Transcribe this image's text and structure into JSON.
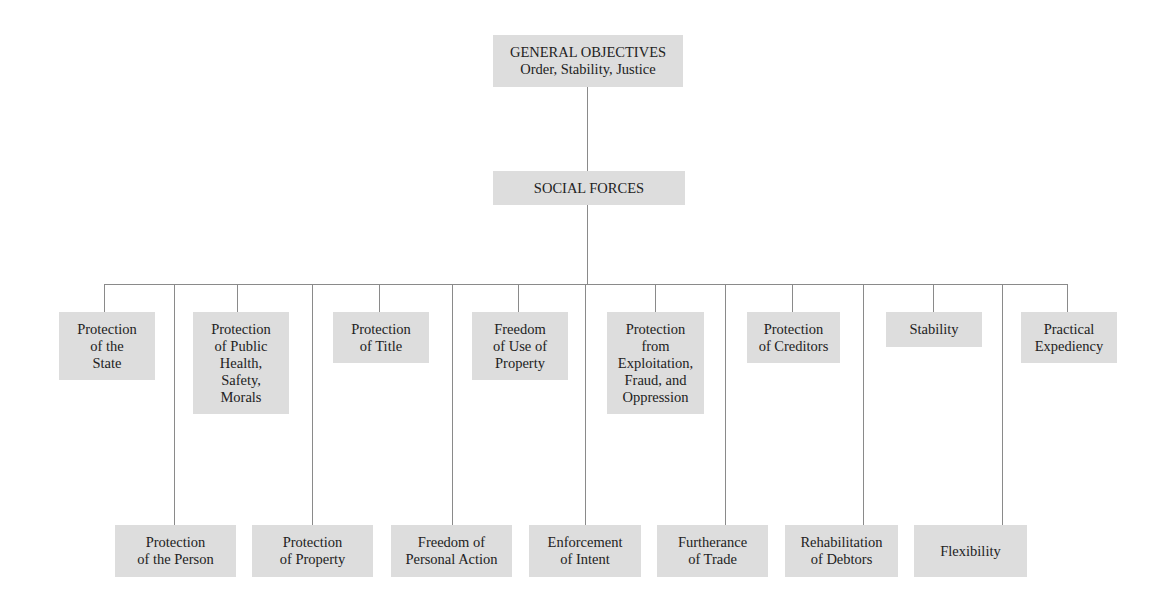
{
  "diagram": {
    "root": {
      "title": "GENERAL OBJECTIVES",
      "subtitle": "Order, Stability, Justice"
    },
    "middle": {
      "title": "SOCIAL FORCES"
    },
    "upper_row": [
      {
        "label": "Protection\nof the\nState"
      },
      {
        "label": "Protection\nof Public\nHealth,\nSafety,\nMorals"
      },
      {
        "label": "Protection\nof Title"
      },
      {
        "label": "Freedom\nof Use of\nProperty"
      },
      {
        "label": "Protection\nfrom\nExploitation,\nFraud, and\nOppression"
      },
      {
        "label": "Protection\nof Creditors"
      },
      {
        "label": "Stability"
      },
      {
        "label": "Practical\nExpediency"
      }
    ],
    "lower_row": [
      {
        "label": "Protection\nof the Person"
      },
      {
        "label": "Protection\nof Property"
      },
      {
        "label": "Freedom of\nPersonal Action"
      },
      {
        "label": "Enforcement\nof Intent"
      },
      {
        "label": "Furtherance\nof Trade"
      },
      {
        "label": "Rehabilitation\nof Debtors"
      },
      {
        "label": "Flexibility"
      }
    ],
    "colors": {
      "box_fill": "#dddddd",
      "line": "#8a8a8a",
      "text": "#222222"
    }
  }
}
